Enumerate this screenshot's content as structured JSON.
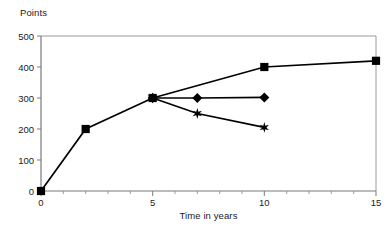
{
  "chart_data": {
    "type": "line",
    "title": "",
    "xlabel": "Time in years",
    "ylabel": "Points",
    "xlim": [
      0,
      15
    ],
    "ylim": [
      0,
      500
    ],
    "xticks": [
      0,
      5,
      10,
      15
    ],
    "xtick_labels": [
      "0",
      "5",
      "10",
      "15"
    ],
    "xminor_step": 1,
    "yticks": [
      0,
      100,
      200,
      300,
      400,
      500
    ],
    "ytick_labels": [
      "0",
      "100",
      "200",
      "300",
      "400",
      "500"
    ],
    "grid": false,
    "legend": "none",
    "line_color": "#000000",
    "axis_color": "#808080",
    "background": "#ffffff",
    "series": [
      {
        "name": "series-squares",
        "marker": "square",
        "x": [
          0,
          2,
          5,
          10,
          15
        ],
        "values": [
          0,
          200,
          300,
          400,
          420
        ]
      },
      {
        "name": "series-diamonds",
        "marker": "diamond",
        "x": [
          5,
          7,
          10
        ],
        "values": [
          300,
          300,
          302
        ]
      },
      {
        "name": "series-stars",
        "marker": "star",
        "x": [
          5,
          7,
          10
        ],
        "values": [
          300,
          250,
          205
        ]
      }
    ]
  },
  "labels": {
    "ylabel": "Points",
    "xlabel": "Time in years",
    "y_500": "500",
    "y_400": "400",
    "y_300": "300",
    "y_200": "200",
    "y_100": "100",
    "y_0": "0",
    "x_0": "0",
    "x_5": "5",
    "x_10": "10",
    "x_15": "15"
  }
}
